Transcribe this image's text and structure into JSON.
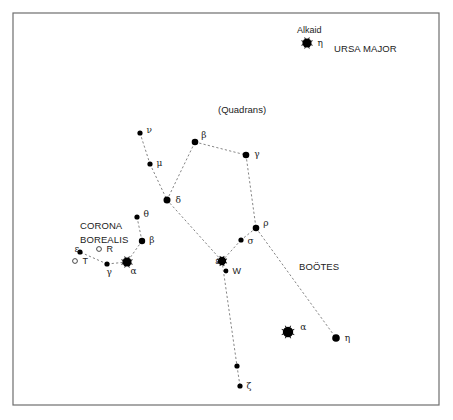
{
  "constellations": {
    "ursa_major": "URSA MAJOR",
    "corona_borealis_1": "CORONA",
    "corona_borealis_2": "BOREALIS",
    "bootes": "BOÖTES",
    "quadrans": "(Quadrans)"
  },
  "named_stars": {
    "alkaid": "Alkaid"
  },
  "stars": [
    {
      "id": "alkaid-eta",
      "label": "η",
      "x": 307,
      "y": 43,
      "r": 4.6,
      "lx": 6,
      "ly": 3
    },
    {
      "id": "boo-nu",
      "label": "ν",
      "x": 140,
      "y": 133,
      "r": 2.6,
      "lx": 4,
      "ly": 0
    },
    {
      "id": "boo-mu",
      "label": "μ",
      "x": 150,
      "y": 164,
      "r": 2.6,
      "lx": 4,
      "ly": 2
    },
    {
      "id": "boo-beta",
      "label": "β",
      "x": 195,
      "y": 142,
      "r": 3.3,
      "lx": 3,
      "ly": -4
    },
    {
      "id": "boo-gamma",
      "label": "γ",
      "x": 246,
      "y": 155,
      "r": 3.3,
      "lx": 5,
      "ly": 2
    },
    {
      "id": "boo-delta",
      "label": "δ",
      "x": 167,
      "y": 200,
      "r": 3.5,
      "lx": 5,
      "ly": 3
    },
    {
      "id": "boo-rho",
      "label": "ρ",
      "x": 256,
      "y": 228,
      "r": 3.3,
      "lx": 4,
      "ly": -2
    },
    {
      "id": "boo-sigma",
      "label": "σ",
      "x": 241,
      "y": 240,
      "r": 2.6,
      "lx": 4,
      "ly": 4
    },
    {
      "id": "boo-epsilon",
      "label": "ε",
      "x": 222,
      "y": 261,
      "r": 4.2,
      "lx": -11,
      "ly": 3
    },
    {
      "id": "boo-w",
      "label": "W",
      "x": 226,
      "y": 271,
      "r": 2.4,
      "lx": 4,
      "ly": 3
    },
    {
      "id": "boo-alpha",
      "label": "α",
      "x": 288,
      "y": 332,
      "r": 5.2,
      "lx": 7,
      "ly": -2
    },
    {
      "id": "boo-eta",
      "label": "η",
      "x": 336,
      "y": 338,
      "r": 3.8,
      "lx": 5,
      "ly": 3
    },
    {
      "id": "boo-unnamed",
      "label": "",
      "x": 237,
      "y": 366,
      "r": 2.6,
      "lx": 0,
      "ly": 0
    },
    {
      "id": "boo-zeta",
      "label": "ζ",
      "x": 240,
      "y": 386,
      "r": 2.6,
      "lx": 4,
      "ly": 3
    },
    {
      "id": "crb-theta",
      "label": "θ",
      "x": 137,
      "y": 217,
      "r": 2.6,
      "lx": 4,
      "ly": 0
    },
    {
      "id": "crb-beta",
      "label": "β",
      "x": 142,
      "y": 241,
      "r": 3.2,
      "lx": 4,
      "ly": 2
    },
    {
      "id": "crb-alpha",
      "label": "α",
      "x": 127,
      "y": 262,
      "r": 4.6,
      "lx": -1,
      "ly": 12
    },
    {
      "id": "crb-gamma",
      "label": "γ",
      "x": 107,
      "y": 264,
      "r": 2.6,
      "lx": -3,
      "ly": 11
    },
    {
      "id": "crb-epsilon",
      "label": "ε",
      "x": 80,
      "y": 252,
      "r": 2.6,
      "lx": -8,
      "ly": 0
    }
  ],
  "variable_stars": [
    {
      "id": "crb-r",
      "label": "R",
      "x": 99,
      "y": 249,
      "r": 2.4,
      "lx": 5,
      "ly": 3
    },
    {
      "id": "crb-t",
      "label": "T",
      "x": 75,
      "y": 261,
      "r": 2.4,
      "lx": 5,
      "ly": 3
    }
  ],
  "connections": [
    [
      "boo-nu",
      "boo-mu"
    ],
    [
      "boo-mu",
      "boo-delta"
    ],
    [
      "boo-delta",
      "boo-beta"
    ],
    [
      "boo-beta",
      "boo-gamma"
    ],
    [
      "boo-gamma",
      "boo-rho"
    ],
    [
      "boo-rho",
      "boo-sigma"
    ],
    [
      "boo-sigma",
      "boo-epsilon"
    ],
    [
      "boo-delta",
      "boo-epsilon"
    ],
    [
      "boo-rho",
      "boo-eta"
    ],
    [
      "boo-epsilon",
      "boo-unnamed"
    ],
    [
      "boo-unnamed",
      "boo-zeta"
    ],
    [
      "crb-theta",
      "crb-beta"
    ],
    [
      "crb-beta",
      "crb-alpha"
    ],
    [
      "crb-alpha",
      "crb-gamma"
    ],
    [
      "crb-gamma",
      "crb-epsilon"
    ]
  ],
  "colors": {
    "background": "#ffffff",
    "star": "#000000",
    "frame": "#6e6e6e",
    "line": "#777777"
  }
}
